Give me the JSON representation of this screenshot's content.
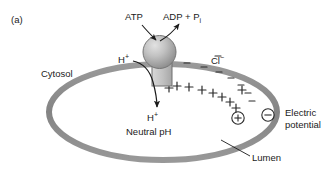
{
  "figure": {
    "panel_label": "(a)",
    "type": "cell-biology-diagram",
    "background_color": "#ffffff",
    "membrane_color": "#8e8e8e",
    "pump_color": "#b0b0b0",
    "text_color": "#1a1a1a"
  },
  "labels": {
    "atp": "ATP",
    "adp": "ADP + P",
    "adp_subscript": "i",
    "proton_cytosol": "H",
    "proton_cytosol_sup": "+",
    "proton_lumen": "H",
    "proton_lumen_sup": "+",
    "neutral_ph": "Neutral pH",
    "cytosol": "Cytosol",
    "chloride": "Cl",
    "chloride_sup": "−",
    "electric_line1": "Electric",
    "electric_line2": "potential",
    "lumen": "Lumen"
  },
  "charges": {
    "positive_symbol": "+",
    "negative_symbol": "−",
    "circled_positive": "⊕",
    "circled_negative": "⊖",
    "positive_count": 9,
    "negative_count": 8,
    "positive_side": "lumen-inner-membrane",
    "negative_side": "cytosol-outer-membrane"
  },
  "arrows": {
    "atp_in": "curved arrow from ATP label into pump head",
    "adp_out": "curved arrow from pump head to ADP + Pi label",
    "proton_transport": "curved arrow from cytosolic H+ through membrane stalk into lumen",
    "lumen_leader": "leader line from Lumen label to membrane"
  }
}
